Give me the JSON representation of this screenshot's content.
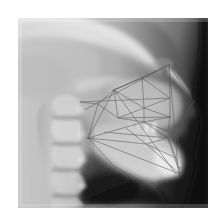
{
  "image": {
    "kind": "lateral-cephalometric-radiograph",
    "modality": "X-ray",
    "view": "lateral / profile, facing right",
    "alt_text": "Lateral cephalometric radiograph of a human skull in profile with cephalometric tracing lines overlaid",
    "caption": "",
    "canvas": {
      "width": 224,
      "height": 222,
      "background": "#ffffff"
    },
    "plate": {
      "x": 18,
      "y": 18,
      "width": 190,
      "height": 190
    }
  },
  "palette": {
    "paper_white": "#ffffff",
    "film_base_gray": "#9a9a9a",
    "soft_tissue_gray": "#b4b4b4",
    "bone_light": "#dcdcdc",
    "bone_bright": "#f0f0f0",
    "air_dark": "#2a2a2a",
    "background_black": "#141414",
    "tracing_line": "#5a5a5a"
  },
  "anatomy": {
    "regions": [
      {
        "name": "cranial-vault",
        "label": "Cranial vault",
        "note": "upper-left, bright calvarium band"
      },
      {
        "name": "cranial-base",
        "label": "Cranial base",
        "note": "sella / sphenoid region, mid image"
      },
      {
        "name": "frontal-sinus",
        "label": "Frontal sinus",
        "note": "upper right of skull outline"
      },
      {
        "name": "orbit",
        "label": "Orbital rim",
        "note": "superimposed orbits, right of center"
      },
      {
        "name": "nasal-bone",
        "label": "Nasal bone and bridge",
        "note": "right profile"
      },
      {
        "name": "maxilla",
        "label": "Maxilla",
        "note": "upper jaw with tooth roots"
      },
      {
        "name": "maxillary-incisor",
        "label": "Maxillary incisors",
        "note": "anterior upper teeth"
      },
      {
        "name": "mandible",
        "label": "Mandible",
        "note": "lower jaw, body and ramus"
      },
      {
        "name": "mandibular-incisor",
        "label": "Mandibular incisors",
        "note": "anterior lower teeth"
      },
      {
        "name": "symphysis",
        "label": "Mandibular symphysis / chin",
        "note": "lower right"
      },
      {
        "name": "gonial-angle",
        "label": "Gonial angle",
        "note": "posterior-inferior mandible"
      },
      {
        "name": "cervical-spine",
        "label": "Cervical vertebrae",
        "note": "left side, C1 through C5 stack"
      },
      {
        "name": "airway",
        "label": "Pharyngeal airway",
        "note": "dark radiolucent column"
      },
      {
        "name": "soft-tissue-profile",
        "label": "Soft tissue profile",
        "note": "nose, lips and chin silhouette at right"
      },
      {
        "name": "occipital-region",
        "label": "Occiput and posterior skull",
        "note": "upper left"
      }
    ]
  },
  "tracing": {
    "visible": true,
    "line_color": "#5a5a5a",
    "description": "Cephalometric analysis overlay: landmark points joined by straight lines forming triangles and reference planes across the midface, maxilla and mandible",
    "planes": [
      {
        "name": "sella-nasion-plane",
        "label": "S-N plane"
      },
      {
        "name": "frankfort-horizontal",
        "label": "Frankfort horizontal"
      },
      {
        "name": "palatal-plane",
        "label": "Palatal plane"
      },
      {
        "name": "occlusal-plane",
        "label": "Occlusal plane"
      },
      {
        "name": "mandibular-plane",
        "label": "Mandibular plane"
      },
      {
        "name": "facial-plane",
        "label": "Facial plane (N-Pog)"
      },
      {
        "name": "y-axis",
        "label": "Y-axis"
      },
      {
        "name": "ramus-plane",
        "label": "Ramus plane"
      }
    ],
    "landmarks": [
      {
        "name": "sella",
        "label": "S"
      },
      {
        "name": "nasion",
        "label": "N"
      },
      {
        "name": "orbitale",
        "label": "Or"
      },
      {
        "name": "porion",
        "label": "Po"
      },
      {
        "name": "anterior-nasal-spine",
        "label": "ANS"
      },
      {
        "name": "posterior-nasal-spine",
        "label": "PNS"
      },
      {
        "name": "point-a",
        "label": "A"
      },
      {
        "name": "point-b",
        "label": "B"
      },
      {
        "name": "pogonion",
        "label": "Pog"
      },
      {
        "name": "menton",
        "label": "Me"
      },
      {
        "name": "gnathion",
        "label": "Gn"
      },
      {
        "name": "gonion",
        "label": "Go"
      },
      {
        "name": "articulare",
        "label": "Ar"
      },
      {
        "name": "basion",
        "label": "Ba"
      }
    ]
  }
}
